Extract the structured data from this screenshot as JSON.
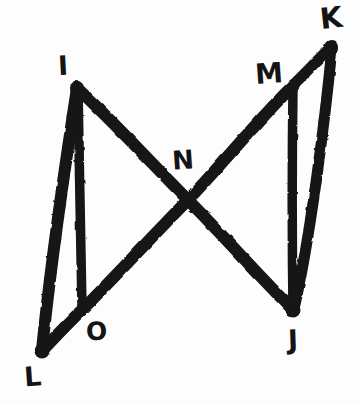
{
  "figure": {
    "background_color": "#fdfdfd",
    "ink_color": "#141414",
    "width": 361,
    "height": 405,
    "vertices": [
      {
        "id": "I",
        "label": "I",
        "x": 77,
        "y": 87,
        "label_x": 58,
        "label_y": 52
      },
      {
        "id": "K",
        "label": "K",
        "x": 331,
        "y": 46,
        "label_x": 320,
        "label_y": 4
      },
      {
        "id": "M",
        "label": "M",
        "x": 293,
        "y": 85,
        "label_x": 255,
        "label_y": 60
      },
      {
        "id": "N",
        "label": "N",
        "x": 188,
        "y": 200,
        "label_x": 172,
        "label_y": 147
      },
      {
        "id": "O",
        "label": "O",
        "x": 82,
        "y": 310,
        "label_x": 86,
        "label_y": 319
      },
      {
        "id": "J",
        "label": "J",
        "x": 293,
        "y": 310,
        "label_x": 288,
        "label_y": 326
      },
      {
        "id": "L",
        "label": "L",
        "x": 42,
        "y": 351,
        "label_x": 24,
        "label_y": 363
      }
    ],
    "edges": [
      {
        "from": "I",
        "to": "L",
        "name": "segment-IL"
      },
      {
        "from": "I",
        "to": "O",
        "name": "segment-IO"
      },
      {
        "from": "I",
        "to": "J",
        "name": "segment-IJ"
      },
      {
        "from": "L",
        "to": "O",
        "name": "segment-LO"
      },
      {
        "from": "O",
        "to": "M",
        "name": "segment-OM"
      },
      {
        "from": "K",
        "to": "M",
        "name": "segment-KM"
      },
      {
        "from": "K",
        "to": "J",
        "name": "segment-KJ"
      },
      {
        "from": "M",
        "to": "J",
        "name": "segment-MJ"
      }
    ]
  }
}
